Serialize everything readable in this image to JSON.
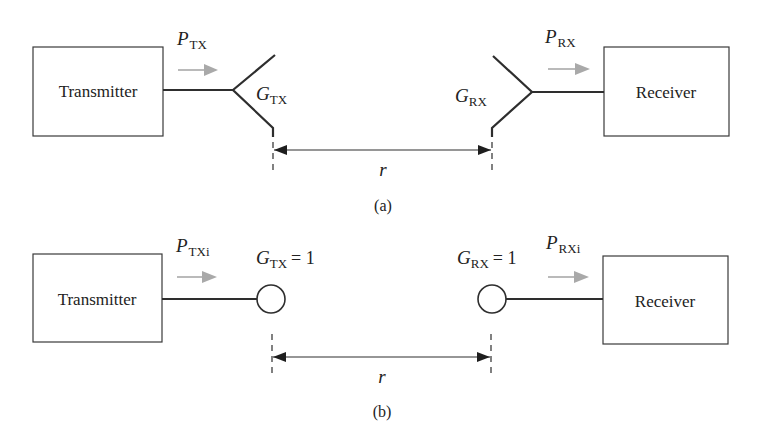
{
  "figure": {
    "panel_a": {
      "caption": "(a)",
      "transmitter": {
        "label": "Transmitter"
      },
      "receiver": {
        "label": "Receiver"
      },
      "tx_power": {
        "symbol": "P",
        "subscript": "TX"
      },
      "rx_power": {
        "symbol": "P",
        "subscript": "RX"
      },
      "tx_gain": {
        "symbol": "G",
        "subscript": "TX"
      },
      "rx_gain": {
        "symbol": "G",
        "subscript": "RX"
      },
      "tx_antenna_icon": "horn-antenna-icon",
      "rx_antenna_icon": "horn-antenna-icon",
      "distance": {
        "label": "r"
      }
    },
    "panel_b": {
      "caption": "(b)",
      "transmitter": {
        "label": "Transmitter"
      },
      "receiver": {
        "label": "Receiver"
      },
      "tx_power": {
        "symbol": "P",
        "subscript": "TXi"
      },
      "rx_power": {
        "symbol": "P",
        "subscript": "RXi"
      },
      "tx_gain": {
        "symbol": "G",
        "subscript": "TX",
        "equals": "= 1"
      },
      "rx_gain": {
        "symbol": "G",
        "subscript": "RX",
        "equals": "= 1"
      },
      "tx_antenna_icon": "isotropic-antenna-icon",
      "rx_antenna_icon": "isotropic-antenna-icon",
      "distance": {
        "label": "r"
      }
    },
    "colors": {
      "line": "#2e2e2e",
      "power_flow_arrow": "#a9a9a9",
      "background": "#ffffff"
    }
  }
}
